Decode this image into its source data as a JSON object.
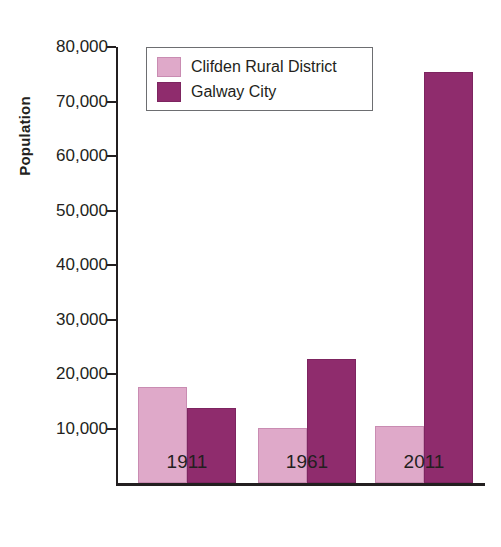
{
  "chart_data": {
    "type": "bar",
    "title": "",
    "xlabel": "",
    "ylabel": "Population",
    "categories": [
      "1911",
      "1961",
      "2011"
    ],
    "series": [
      {
        "name": "Clifden Rural District",
        "color": "#dfa9c9",
        "values": [
          17700,
          10100,
          10400
        ]
      },
      {
        "name": "Galway City",
        "color": "#8f2c6d",
        "values": [
          13700,
          22700,
          75400
        ]
      }
    ],
    "ylim": [
      0,
      80000
    ],
    "ytick_values": [
      10000,
      20000,
      30000,
      40000,
      50000,
      60000,
      70000,
      80000
    ],
    "ytick_labels": [
      "10,000",
      "20,000",
      "30,000",
      "40,000",
      "50,000",
      "60,000",
      "70,000",
      "80,000"
    ],
    "grid": false,
    "legend_position": "top-left-inside"
  },
  "axes": {
    "y_title": "Population"
  },
  "legend": {
    "entries": [
      {
        "label": "Clifden Rural District",
        "swatch": "series-a-swatch"
      },
      {
        "label": "Galway City",
        "swatch": "series-b-swatch"
      }
    ]
  }
}
